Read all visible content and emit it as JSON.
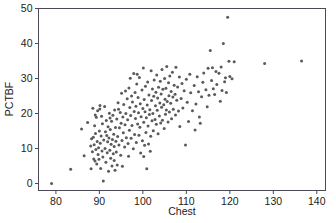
{
  "chart_data": {
    "type": "scatter",
    "title": "",
    "xlabel": "Chest",
    "ylabel": "PCTBF",
    "xlim": [
      76,
      142
    ],
    "ylim": [
      -2,
      50
    ],
    "xticks": [
      80,
      90,
      100,
      110,
      120,
      130,
      140
    ],
    "yticks": [
      0,
      10,
      20,
      30,
      40,
      50
    ],
    "grid": false,
    "legend": null,
    "marker": {
      "shape": "circle",
      "color": "#5a5a5a",
      "size_px": 3
    },
    "n_points": 248,
    "points": [
      [
        79.0,
        0.0
      ],
      [
        83.4,
        4.1
      ],
      [
        85.9,
        15.6
      ],
      [
        86.5,
        7.9
      ],
      [
        87.3,
        17.4
      ],
      [
        88.0,
        10.7
      ],
      [
        88.1,
        4.2
      ],
      [
        88.2,
        12.8
      ],
      [
        88.4,
        9.1
      ],
      [
        88.5,
        21.5
      ],
      [
        88.6,
        13.2
      ],
      [
        88.7,
        7.0
      ],
      [
        88.8,
        11.1
      ],
      [
        88.9,
        16.5
      ],
      [
        89.0,
        6.4
      ],
      [
        89.1,
        14.3
      ],
      [
        89.2,
        9.7
      ],
      [
        89.3,
        18.9
      ],
      [
        89.4,
        5.6
      ],
      [
        89.5,
        12.0
      ],
      [
        89.6,
        20.8
      ],
      [
        89.7,
        8.3
      ],
      [
        89.8,
        10.2
      ],
      [
        89.9,
        6.9
      ],
      [
        90.0,
        15.0
      ],
      [
        90.1,
        21.3
      ],
      [
        90.2,
        11.5
      ],
      [
        90.3,
        4.3
      ],
      [
        90.4,
        13.6
      ],
      [
        90.5,
        19.2
      ],
      [
        90.6,
        9.3
      ],
      [
        90.7,
        17.1
      ],
      [
        90.8,
        7.6
      ],
      [
        90.9,
        0.7
      ],
      [
        91.0,
        12.4
      ],
      [
        91.2,
        22.0
      ],
      [
        91.3,
        10.0
      ],
      [
        91.4,
        14.8
      ],
      [
        91.5,
        6.1
      ],
      [
        91.6,
        18.0
      ],
      [
        91.8,
        8.8
      ],
      [
        91.9,
        11.9
      ],
      [
        92.0,
        16.2
      ],
      [
        92.1,
        3.5
      ],
      [
        92.2,
        13.0
      ],
      [
        92.3,
        20.1
      ],
      [
        92.4,
        9.5
      ],
      [
        92.5,
        15.4
      ],
      [
        92.6,
        7.2
      ],
      [
        92.7,
        11.2
      ],
      [
        92.8,
        17.8
      ],
      [
        92.9,
        5.0
      ],
      [
        93.0,
        12.6
      ],
      [
        93.1,
        19.5
      ],
      [
        93.2,
        8.5
      ],
      [
        93.3,
        14.1
      ],
      [
        93.4,
        10.6
      ],
      [
        93.5,
        21.0
      ],
      [
        93.6,
        3.8
      ],
      [
        93.7,
        16.0
      ],
      [
        93.8,
        12.1
      ],
      [
        93.9,
        9.0
      ],
      [
        94.0,
        18.4
      ],
      [
        94.2,
        13.4
      ],
      [
        94.3,
        23.1
      ],
      [
        94.5,
        11.0
      ],
      [
        94.6,
        15.9
      ],
      [
        94.8,
        20.3
      ],
      [
        94.9,
        8.1
      ],
      [
        95.0,
        17.2
      ],
      [
        95.1,
        25.8
      ],
      [
        95.2,
        12.3
      ],
      [
        95.4,
        19.0
      ],
      [
        95.5,
        14.5
      ],
      [
        95.6,
        22.6
      ],
      [
        95.8,
        10.4
      ],
      [
        95.9,
        16.8
      ],
      [
        96.0,
        26.4
      ],
      [
        96.1,
        20.0
      ],
      [
        96.2,
        13.1
      ],
      [
        96.4,
        24.2
      ],
      [
        96.5,
        18.2
      ],
      [
        96.6,
        11.4
      ],
      [
        96.8,
        27.3
      ],
      [
        96.9,
        15.2
      ],
      [
        97.0,
        21.7
      ],
      [
        97.1,
        30.1
      ],
      [
        97.2,
        19.4
      ],
      [
        97.3,
        12.9
      ],
      [
        97.4,
        25.0
      ],
      [
        97.5,
        16.6
      ],
      [
        97.6,
        23.3
      ],
      [
        97.8,
        9.9
      ],
      [
        97.9,
        31.4
      ],
      [
        98.0,
        20.6
      ],
      [
        98.1,
        14.0
      ],
      [
        98.2,
        26.0
      ],
      [
        98.3,
        18.6
      ],
      [
        98.4,
        22.1
      ],
      [
        98.5,
        11.7
      ],
      [
        98.6,
        28.4
      ],
      [
        98.8,
        17.0
      ],
      [
        98.9,
        24.6
      ],
      [
        99.0,
        20.2
      ],
      [
        99.1,
        13.8
      ],
      [
        99.2,
        30.3
      ],
      [
        99.3,
        16.1
      ],
      [
        99.4,
        22.8
      ],
      [
        99.5,
        8.7
      ],
      [
        99.6,
        19.1
      ],
      [
        99.8,
        26.7
      ],
      [
        99.9,
        12.2
      ],
      [
        100.0,
        21.4
      ],
      [
        100.1,
        33.0
      ],
      [
        100.2,
        17.5
      ],
      [
        100.3,
        24.0
      ],
      [
        100.4,
        10.9
      ],
      [
        100.5,
        20.5
      ],
      [
        100.6,
        27.8
      ],
      [
        100.7,
        14.6
      ],
      [
        100.8,
        18.8
      ],
      [
        100.9,
        4.2
      ],
      [
        101.0,
        22.4
      ],
      [
        101.1,
        29.0
      ],
      [
        101.2,
        16.4
      ],
      [
        101.3,
        11.3
      ],
      [
        101.4,
        25.3
      ],
      [
        101.5,
        19.7
      ],
      [
        101.6,
        21.1
      ],
      [
        101.8,
        13.5
      ],
      [
        101.9,
        32.2
      ],
      [
        102.0,
        23.7
      ],
      [
        102.1,
        17.9
      ],
      [
        102.2,
        27.0
      ],
      [
        102.3,
        20.0
      ],
      [
        102.4,
        15.1
      ],
      [
        102.5,
        24.9
      ],
      [
        102.6,
        29.6
      ],
      [
        102.8,
        18.3
      ],
      [
        102.9,
        22.2
      ],
      [
        103.0,
        26.1
      ],
      [
        103.1,
        16.9
      ],
      [
        103.2,
        31.0
      ],
      [
        103.3,
        20.9
      ],
      [
        103.4,
        24.4
      ],
      [
        103.5,
        14.2
      ],
      [
        103.6,
        27.5
      ],
      [
        103.8,
        19.3
      ],
      [
        103.9,
        23.0
      ],
      [
        104.0,
        29.2
      ],
      [
        104.1,
        17.3
      ],
      [
        104.2,
        25.6
      ],
      [
        104.3,
        21.8
      ],
      [
        104.4,
        32.6
      ],
      [
        104.5,
        18.1
      ],
      [
        104.6,
        26.9
      ],
      [
        104.8,
        22.5
      ],
      [
        104.9,
        15.7
      ],
      [
        105.0,
        30.0
      ],
      [
        105.1,
        24.1
      ],
      [
        105.2,
        19.8
      ],
      [
        105.3,
        27.2
      ],
      [
        105.4,
        21.0
      ],
      [
        105.5,
        33.4
      ],
      [
        105.6,
        23.4
      ],
      [
        105.8,
        17.6
      ],
      [
        105.9,
        28.8
      ],
      [
        106.0,
        25.1
      ],
      [
        106.1,
        20.4
      ],
      [
        106.2,
        30.7
      ],
      [
        106.4,
        22.9
      ],
      [
        106.5,
        26.3
      ],
      [
        106.6,
        18.5
      ],
      [
        106.8,
        31.8
      ],
      [
        106.9,
        24.7
      ],
      [
        107.0,
        21.2
      ],
      [
        107.2,
        28.1
      ],
      [
        107.4,
        25.5
      ],
      [
        107.5,
        19.6
      ],
      [
        107.6,
        33.2
      ],
      [
        107.8,
        23.8
      ],
      [
        108.0,
        27.6
      ],
      [
        108.2,
        20.7
      ],
      [
        108.4,
        30.4
      ],
      [
        108.5,
        16.3
      ],
      [
        108.8,
        24.3
      ],
      [
        109.0,
        28.6
      ],
      [
        109.2,
        21.6
      ],
      [
        109.5,
        26.5
      ],
      [
        109.8,
        11.0
      ],
      [
        110.0,
        29.8
      ],
      [
        110.2,
        23.2
      ],
      [
        110.5,
        17.7
      ],
      [
        110.8,
        31.2
      ],
      [
        111.0,
        25.9
      ],
      [
        111.4,
        20.8
      ],
      [
        111.8,
        28.0
      ],
      [
        112.0,
        15.3
      ],
      [
        112.2,
        22.7
      ],
      [
        112.5,
        30.5
      ],
      [
        112.8,
        26.2
      ],
      [
        113.0,
        19.0
      ],
      [
        113.2,
        17.2
      ],
      [
        113.5,
        24.8
      ],
      [
        113.8,
        28.9
      ],
      [
        114.0,
        31.6
      ],
      [
        114.5,
        26.8
      ],
      [
        114.8,
        21.9
      ],
      [
        115.0,
        32.9
      ],
      [
        115.2,
        25.2
      ],
      [
        115.5,
        38.0
      ],
      [
        115.8,
        29.4
      ],
      [
        116.0,
        33.1
      ],
      [
        116.2,
        27.1
      ],
      [
        116.5,
        25.4
      ],
      [
        116.8,
        32.0
      ],
      [
        117.0,
        28.3
      ],
      [
        117.5,
        31.5
      ],
      [
        117.8,
        23.5
      ],
      [
        118.0,
        33.3
      ],
      [
        118.2,
        26.6
      ],
      [
        118.5,
        40.0
      ],
      [
        118.8,
        29.1
      ],
      [
        119.0,
        30.2
      ],
      [
        119.2,
        26.0
      ],
      [
        119.5,
        47.5
      ],
      [
        119.8,
        34.9
      ],
      [
        120.0,
        30.6
      ],
      [
        120.5,
        29.9
      ],
      [
        121.0,
        34.8
      ],
      [
        128.0,
        34.3
      ],
      [
        136.5,
        35.0
      ],
      [
        93.4,
        6.6
      ],
      [
        94.1,
        5.3
      ],
      [
        95.3,
        4.9
      ],
      [
        96.7,
        7.8
      ],
      [
        100.2,
        7.7
      ],
      [
        101.7,
        9.2
      ],
      [
        89.05,
        19.6
      ],
      [
        90.15,
        22.3
      ],
      [
        91.7,
        13.7
      ],
      [
        92.45,
        18.7
      ],
      [
        94.4,
        21.2
      ],
      [
        98.7,
        31.2
      ]
    ]
  },
  "axis": {
    "x_tick_labels": [
      "80",
      "90",
      "100",
      "110",
      "120",
      "130",
      "140"
    ],
    "y_tick_labels": [
      "0",
      "10",
      "20",
      "30",
      "40",
      "50"
    ]
  },
  "colors": {
    "marker": "#5a5a5a",
    "frame": "#4a4a56",
    "text": "#222222",
    "background": "#ffffff"
  }
}
